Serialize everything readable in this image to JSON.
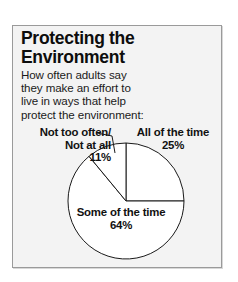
{
  "card": {
    "title_line1": "Protecting the",
    "title_line2": "Environment",
    "subtitle_line1": "How often adults say",
    "subtitle_line2": "they make an effort to",
    "subtitle_line3": "live in ways that help",
    "subtitle_line4": "protect the environment:"
  },
  "labels": {
    "not_too_often_line1": "Not too often/",
    "not_too_often_line2": "Not at all",
    "not_too_often_pct": "11%",
    "all_of_the_time_name": "All of the time",
    "all_of_the_time_pct": "25%",
    "some_of_the_time_name": "Some of the time",
    "some_of_the_time_pct": "64%"
  },
  "colors": {
    "card_background": "#f3f3f3",
    "card_border": "#9a9a9a",
    "slice_fill": "#ffffff",
    "slice_stroke": "#1a1a1a",
    "text": "#111111"
  },
  "chart_data": {
    "type": "pie",
    "title": "Protecting the Environment",
    "subtitle": "How often adults say they make an effort to live in ways that help protect the environment:",
    "categories": [
      "All of the time",
      "Some of the time",
      "Not too often/Not at all"
    ],
    "values": [
      25,
      64,
      11
    ],
    "value_labels": [
      "25%",
      "64%",
      "11%"
    ],
    "unit": "percent",
    "total": 100,
    "start_angle_deg": 0,
    "direction": "clockwise",
    "legend": "none",
    "labels_position": "callout",
    "slice_fills": [
      "#ffffff",
      "#ffffff",
      "#ffffff"
    ],
    "slice_stroke": "#1a1a1a",
    "grid": false
  }
}
